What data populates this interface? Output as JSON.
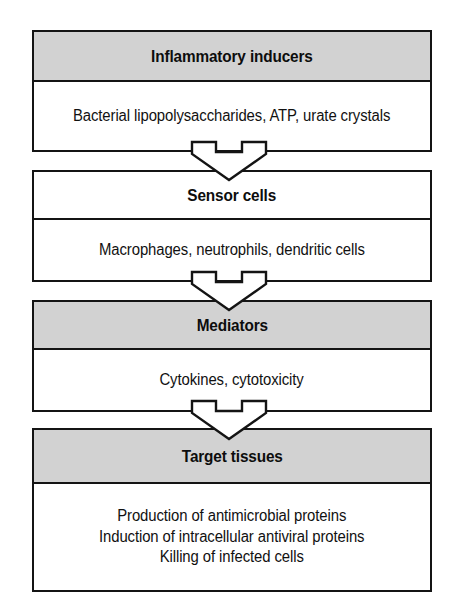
{
  "diagram": {
    "type": "flow-diagram",
    "orientation": "vertical-top-down",
    "colors": {
      "header_fill": "#d2d2d2",
      "body_fill": "#ffffff",
      "border": "#141414",
      "text": "#111111",
      "arrow_fill": "#ffffff",
      "arrow_stroke": "#141414",
      "page_background": "#ffffff"
    },
    "stages": [
      {
        "id": "inducers",
        "header": "Inflammatory inducers",
        "body_lines": [
          "Bacterial lipopolysaccharides, ATP, urate crystals"
        ],
        "header_shaded": true
      },
      {
        "id": "sensor",
        "header": "Sensor cells",
        "body_lines": [
          "Macrophages, neutrophils, dendritic cells"
        ],
        "header_shaded": false
      },
      {
        "id": "mediators",
        "header": "Mediators",
        "body_lines": [
          "Cytokines, cytotoxicity"
        ],
        "header_shaded": true
      },
      {
        "id": "target",
        "header": "Target tissues",
        "body_lines": [
          "Production of antimicrobial proteins",
          "Induction of intracellular antiviral proteins",
          "Killing of infected cells"
        ],
        "header_shaded": true
      }
    ],
    "connectors": [
      {
        "id": "connector-1",
        "from": "inducers",
        "to": "sensor",
        "icon": "down-arrow-icon"
      },
      {
        "id": "connector-2",
        "from": "sensor",
        "to": "mediators",
        "icon": "down-arrow-icon"
      },
      {
        "id": "connector-3",
        "from": "mediators",
        "to": "target",
        "icon": "down-arrow-icon"
      }
    ]
  }
}
